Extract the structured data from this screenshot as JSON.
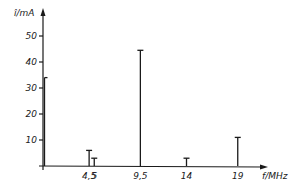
{
  "chart_data": {
    "type": "bar",
    "subtype": "spectrum-lines",
    "title": "",
    "xlabel": "f/MHz",
    "ylabel": "î/mA",
    "x": [
      0,
      4.5,
      5,
      9.5,
      14,
      19
    ],
    "values": [
      34,
      6,
      3,
      44.5,
      3,
      11
    ],
    "x_tick_labels": [
      "4,5",
      "5",
      "9,5",
      "14",
      "19"
    ],
    "x_tick_values": [
      4.5,
      5,
      9.5,
      14,
      19
    ],
    "y_ticks": [
      10,
      20,
      30,
      40,
      50
    ],
    "y_tick_labels": [
      "10",
      "20",
      "30",
      "40",
      "50"
    ],
    "xlim": [
      0,
      22
    ],
    "ylim": [
      0,
      55
    ],
    "grid": false,
    "legend": "none"
  }
}
